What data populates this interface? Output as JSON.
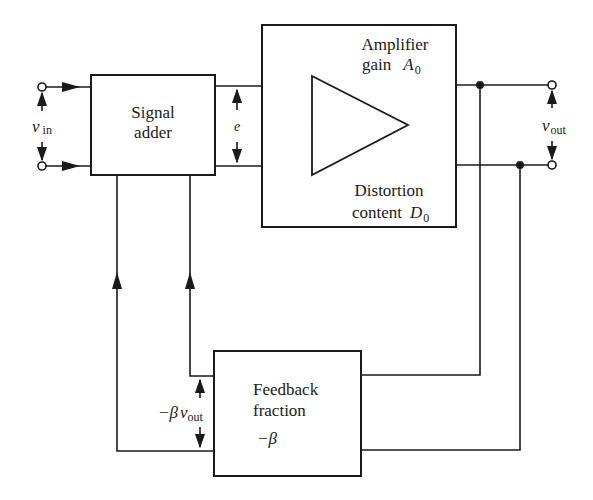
{
  "diagram": {
    "type": "block-diagram",
    "blocks": {
      "signal_adder": {
        "line1": "Signal",
        "line2": "adder"
      },
      "amplifier": {
        "line1": "Amplifier",
        "line2_prefix": "gain",
        "gain_symbol": "A",
        "gain_sub": "0",
        "line3": "Distortion",
        "line4_prefix": "content",
        "distortion_symbol": "D",
        "distortion_sub": "0"
      },
      "feedback": {
        "line1": "Feedback",
        "line2": "fraction",
        "beta": "−β"
      }
    },
    "labels": {
      "v_in_main": "v",
      "v_in_sub": "in",
      "error": "e",
      "v_out_main": "v",
      "v_out_sub": "out",
      "feedback_prefix": "−β",
      "feedback_v": "v",
      "feedback_sub": "out"
    },
    "colors": {
      "line": "#1a1a1a",
      "background": "#ffffff"
    }
  }
}
